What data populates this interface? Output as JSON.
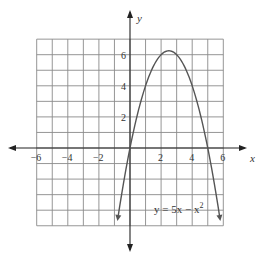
{
  "chart_data": {
    "type": "line",
    "title": "",
    "xlabel": "x",
    "ylabel": "y",
    "xlim": [
      -6,
      6
    ],
    "ylim": [
      -5,
      7
    ],
    "grid": true,
    "x_ticks": [
      "−6",
      "−4",
      "−2",
      "2",
      "4",
      "6"
    ],
    "y_ticks": [
      "2",
      "4",
      "6"
    ],
    "series": [
      {
        "name": "y = 5x − x²",
        "equation": "y = 5x - x^2",
        "x": [
          -0.8,
          0,
          1,
          2,
          2.5,
          3,
          4,
          5,
          5.8
        ],
        "values": [
          -4.64,
          0,
          4,
          6,
          6.25,
          6,
          4,
          0,
          -4.64
        ]
      }
    ],
    "annotations": [
      {
        "text": "y = 5x − x",
        "superscript": "2",
        "x": 3.8,
        "y": -3.6
      }
    ]
  },
  "labels": {
    "x_axis": "x",
    "y_axis": "y",
    "equation_main": "y = 5x − x",
    "equation_sup": "2"
  }
}
